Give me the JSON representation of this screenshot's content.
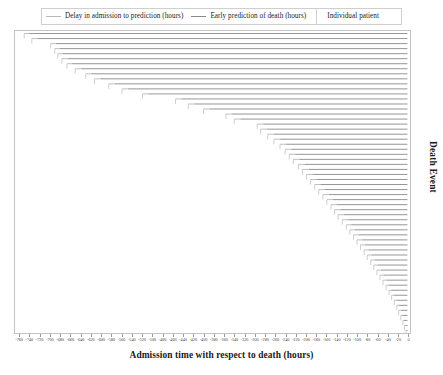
{
  "legend": {
    "entries": [
      {
        "label": "Delay in admission to prediction (hours)",
        "style": "delay",
        "color": "#b9b9b9"
      },
      {
        "label": "Early prediction of death (hours)",
        "style": "early",
        "color": "#8a8a8a"
      }
    ],
    "annotation": "Individual patient"
  },
  "axes": {
    "x_title": "Admission time with respect to death (hours)",
    "y_title": "Death Event"
  },
  "chart_data": {
    "type": "bar",
    "orientation": "horizontal",
    "title": "",
    "subtitle": "",
    "xlabel": "Admission time with respect to death (hours)",
    "ylabel": "Death Event",
    "xlim": [
      -770,
      5
    ],
    "ylim": [
      0,
      60
    ],
    "grid": false,
    "legend_position": "top",
    "x_tick_step": 20,
    "xticks": [
      -760,
      -740,
      -720,
      -700,
      -680,
      -660,
      -640,
      -620,
      -600,
      -580,
      -560,
      -540,
      -520,
      -500,
      -480,
      -460,
      -440,
      -420,
      -400,
      -380,
      -360,
      -340,
      -320,
      -300,
      -280,
      -260,
      -240,
      -220,
      -200,
      -180,
      -160,
      -140,
      -120,
      -100,
      -80,
      -60,
      -40,
      -20,
      0
    ],
    "xticklabels": [
      "-760",
      "-740",
      "-720",
      "-700",
      "-680",
      "-660",
      "-640",
      "-620",
      "-600",
      "-580",
      "-560",
      "-540",
      "-520",
      "-500",
      "-480",
      "-460",
      "-440",
      "-420",
      "-400",
      "-380",
      "-360",
      "-340",
      "-320",
      "-300",
      "-280",
      "-260",
      "-240",
      "-220",
      "-200",
      "-180",
      "-160",
      "-140",
      "-120",
      "-100",
      "-80",
      "-60",
      "-40",
      "-20",
      "0"
    ],
    "series": [
      {
        "name": "Delay in admission to prediction (hours)",
        "color": "#b9b9b9",
        "description": "Light segment from admission time to prediction time for each patient"
      },
      {
        "name": "Early prediction of death (hours)",
        "color": "#8a8a8a",
        "description": "Darker segment from prediction time to death at hour 0"
      }
    ],
    "patients": [
      {
        "index": 0,
        "admission": -752,
        "prediction": -742
      },
      {
        "index": 1,
        "admission": -737,
        "prediction": -726
      },
      {
        "index": 2,
        "admission": -700,
        "prediction": -690
      },
      {
        "index": 3,
        "admission": -692,
        "prediction": -682
      },
      {
        "index": 4,
        "admission": -686,
        "prediction": -676
      },
      {
        "index": 5,
        "admission": -678,
        "prediction": -666
      },
      {
        "index": 6,
        "admission": -668,
        "prediction": -658
      },
      {
        "index": 7,
        "admission": -652,
        "prediction": -640
      },
      {
        "index": 8,
        "admission": -631,
        "prediction": -620
      },
      {
        "index": 9,
        "admission": -614,
        "prediction": -602
      },
      {
        "index": 10,
        "admission": -586,
        "prediction": -574
      },
      {
        "index": 11,
        "admission": -560,
        "prediction": -548
      },
      {
        "index": 12,
        "admission": -520,
        "prediction": -508
      },
      {
        "index": 13,
        "admission": -455,
        "prediction": -443
      },
      {
        "index": 14,
        "admission": -430,
        "prediction": -418
      },
      {
        "index": 15,
        "admission": -400,
        "prediction": -388
      },
      {
        "index": 16,
        "admission": -356,
        "prediction": -344
      },
      {
        "index": 17,
        "admission": -340,
        "prediction": -328
      },
      {
        "index": 18,
        "admission": -295,
        "prediction": -283
      },
      {
        "index": 19,
        "admission": -288,
        "prediction": -276
      },
      {
        "index": 20,
        "admission": -274,
        "prediction": -262
      },
      {
        "index": 21,
        "admission": -262,
        "prediction": -250
      },
      {
        "index": 22,
        "admission": -250,
        "prediction": -238
      },
      {
        "index": 23,
        "admission": -240,
        "prediction": -228
      },
      {
        "index": 24,
        "admission": -232,
        "prediction": -220
      },
      {
        "index": 25,
        "admission": -224,
        "prediction": -212
      },
      {
        "index": 26,
        "admission": -214,
        "prediction": -202
      },
      {
        "index": 27,
        "admission": -206,
        "prediction": -194
      },
      {
        "index": 28,
        "admission": -198,
        "prediction": -186
      },
      {
        "index": 29,
        "admission": -190,
        "prediction": -178
      },
      {
        "index": 30,
        "admission": -182,
        "prediction": -170
      },
      {
        "index": 31,
        "admission": -174,
        "prediction": -162
      },
      {
        "index": 32,
        "admission": -166,
        "prediction": -154
      },
      {
        "index": 33,
        "admission": -158,
        "prediction": -146
      },
      {
        "index": 34,
        "admission": -150,
        "prediction": -139
      },
      {
        "index": 35,
        "admission": -143,
        "prediction": -132
      },
      {
        "index": 36,
        "admission": -136,
        "prediction": -125
      },
      {
        "index": 37,
        "admission": -128,
        "prediction": -117
      },
      {
        "index": 38,
        "admission": -120,
        "prediction": -110
      },
      {
        "index": 39,
        "admission": -113,
        "prediction": -103
      },
      {
        "index": 40,
        "admission": -106,
        "prediction": -96
      },
      {
        "index": 41,
        "admission": -99,
        "prediction": -89
      },
      {
        "index": 42,
        "admission": -92,
        "prediction": -83
      },
      {
        "index": 43,
        "admission": -85,
        "prediction": -76
      },
      {
        "index": 44,
        "admission": -79,
        "prediction": -70
      },
      {
        "index": 45,
        "admission": -72,
        "prediction": -64
      },
      {
        "index": 46,
        "admission": -66,
        "prediction": -58
      },
      {
        "index": 47,
        "admission": -60,
        "prediction": -52
      },
      {
        "index": 48,
        "admission": -54,
        "prediction": -47
      },
      {
        "index": 49,
        "admission": -48,
        "prediction": -41
      },
      {
        "index": 50,
        "admission": -42,
        "prediction": -36
      },
      {
        "index": 51,
        "admission": -36,
        "prediction": -31
      },
      {
        "index": 52,
        "admission": -31,
        "prediction": -26
      },
      {
        "index": 53,
        "admission": -26,
        "prediction": -21
      },
      {
        "index": 54,
        "admission": -21,
        "prediction": -17
      },
      {
        "index": 55,
        "admission": -17,
        "prediction": -13
      },
      {
        "index": 56,
        "admission": -13,
        "prediction": -10
      },
      {
        "index": 57,
        "admission": -9,
        "prediction": -7
      },
      {
        "index": 58,
        "admission": -6,
        "prediction": -4
      },
      {
        "index": 59,
        "admission": -3,
        "prediction": -2
      }
    ]
  }
}
